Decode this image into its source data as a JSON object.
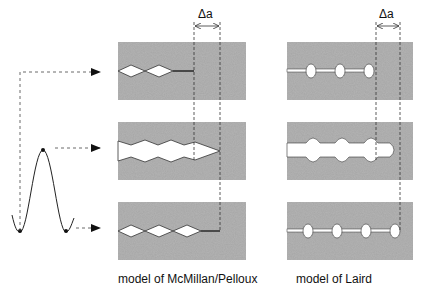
{
  "figure": {
    "delta_label_left": "Δa",
    "delta_label_right": "Δa",
    "caption_left": "model of McMillan/Pelloux",
    "caption_right": "model of Laird"
  },
  "load_cycle": {
    "shape": "sine wave",
    "marked_points": [
      "minimum-left",
      "maximum",
      "minimum-right"
    ]
  },
  "panels": {
    "mcmillan_pelloux": [
      "crack closed (start of cycle)",
      "crack opened at max load (blunted, advanced by Δa)",
      "crack closed at end of cycle (re-sharpened, advanced)"
    ],
    "laird": [
      "sharp crack with voids",
      "crack tip blunted at max load",
      "re-sharpened crack advanced by Δa"
    ]
  },
  "colors": {
    "material": "#a9a9a9",
    "crack": "#ffffff",
    "line": "#333333"
  }
}
